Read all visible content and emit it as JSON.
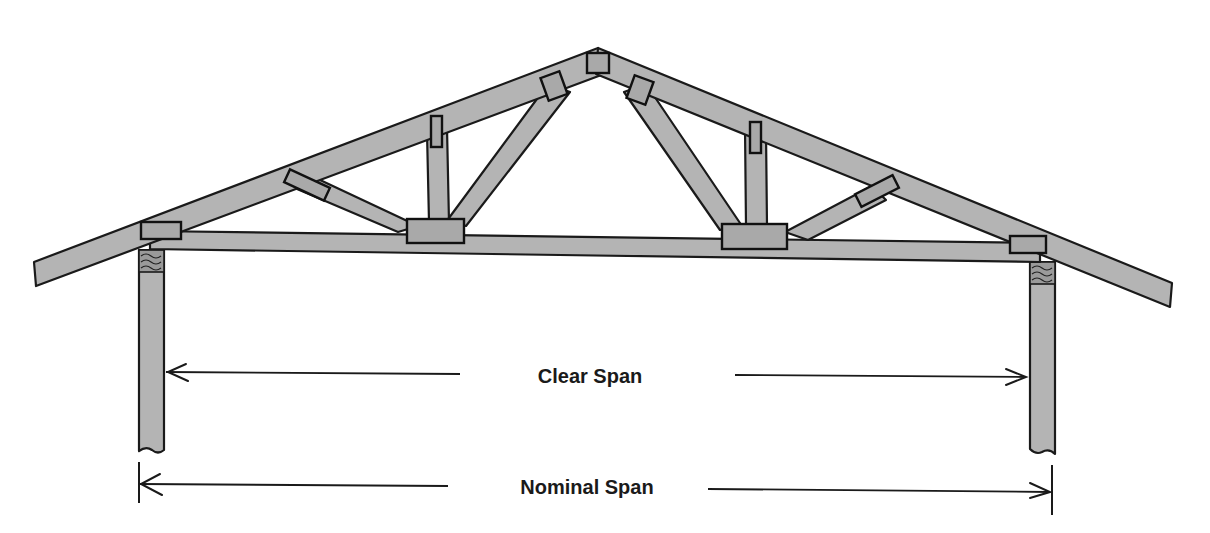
{
  "diagram": {
    "colors": {
      "lumber": "#b4b4b4",
      "plate": "#a9a9a9",
      "outline": "#1a1a1a",
      "background": "#ffffff"
    },
    "labels": {
      "clear_span": "Clear Span",
      "nominal_span": "Nominal Span"
    },
    "dimensions": {
      "clear_span": {
        "x1": 166,
        "x2": 1028,
        "y": 375,
        "label_x": 590,
        "label_y": 365,
        "gap_from": 460,
        "gap_to": 735
      },
      "nominal_span": {
        "x1": 140,
        "x2": 1052,
        "y": 488,
        "label_x": 587,
        "label_y": 476,
        "gap_from": 448,
        "gap_to": 708,
        "tick_top": 462,
        "tick_bottom": 518
      }
    },
    "truss": {
      "apex": [
        598,
        50
      ],
      "left_overhang_end": [
        35,
        272
      ],
      "right_overhang_end": [
        1172,
        296
      ],
      "bottom_chord_y_left": 233,
      "bottom_chord_y_right": 250,
      "members": [
        "top-chord-left",
        "top-chord-right",
        "bottom-chord",
        "web-left-diagonal-outer",
        "web-left-vertical",
        "web-left-diagonal-inner",
        "web-right-diagonal-inner",
        "web-right-vertical",
        "web-right-diagonal-outer"
      ],
      "gusset_plates": 9
    },
    "supports": [
      {
        "name": "left-wall-post",
        "x": 140,
        "width": 24,
        "top": 250,
        "bottom": 452
      },
      {
        "name": "right-wall-post",
        "x": 1030,
        "width": 24,
        "top": 262,
        "bottom": 452
      }
    ]
  }
}
